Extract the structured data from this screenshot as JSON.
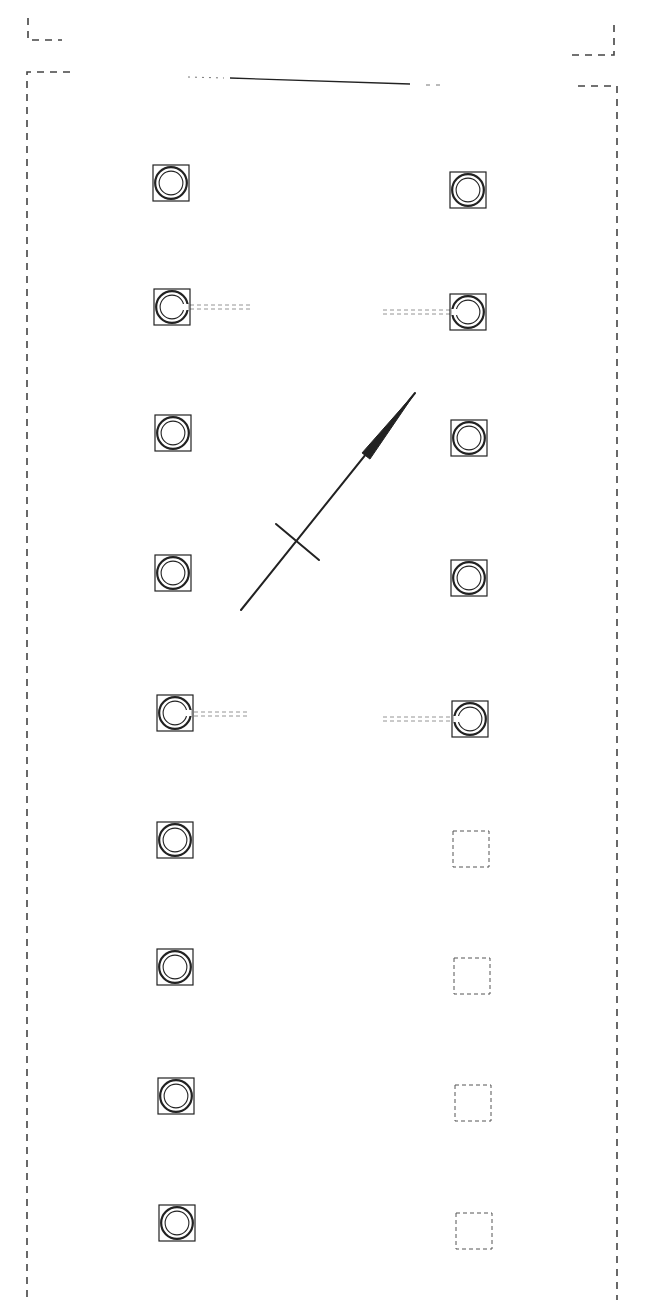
{
  "diagram": {
    "type": "architectural-plan",
    "canvas": {
      "width": 649,
      "height": 1309,
      "background": "#ffffff"
    },
    "stroke_color": "#222222",
    "dashed_color": "#444444",
    "boundary": {
      "upper_left_corner": {
        "x": 28,
        "y": 18,
        "hx": 62
      },
      "upper_right_corner": {
        "x": 614,
        "y": 25,
        "hx": 572
      },
      "outer_left": {
        "x": 27,
        "top": 72,
        "bottom": 1300,
        "hx": 70
      },
      "outer_right": {
        "x": 617,
        "top": 86,
        "bottom": 1300,
        "hx": 578
      },
      "top_line": {
        "x1": 230,
        "y1": 78,
        "x2": 410,
        "y2": 84,
        "dots_left": 188,
        "dots_right": 444
      }
    },
    "columns_left": [
      {
        "x": 153,
        "y": 165,
        "size": 36,
        "type": "column"
      },
      {
        "x": 154,
        "y": 289,
        "size": 36,
        "type": "column",
        "tie": "right"
      },
      {
        "x": 155,
        "y": 415,
        "size": 36,
        "type": "column"
      },
      {
        "x": 155,
        "y": 555,
        "size": 36,
        "type": "column"
      },
      {
        "x": 157,
        "y": 695,
        "size": 36,
        "type": "column",
        "tie": "right"
      },
      {
        "x": 157,
        "y": 822,
        "size": 36,
        "type": "column"
      },
      {
        "x": 157,
        "y": 949,
        "size": 36,
        "type": "column"
      },
      {
        "x": 158,
        "y": 1078,
        "size": 36,
        "type": "column"
      },
      {
        "x": 159,
        "y": 1205,
        "size": 36,
        "type": "column"
      }
    ],
    "columns_right": [
      {
        "x": 450,
        "y": 172,
        "size": 36,
        "type": "column"
      },
      {
        "x": 450,
        "y": 294,
        "size": 36,
        "type": "column",
        "tie": "left"
      },
      {
        "x": 451,
        "y": 420,
        "size": 36,
        "type": "column"
      },
      {
        "x": 451,
        "y": 560,
        "size": 36,
        "type": "column"
      },
      {
        "x": 452,
        "y": 701,
        "size": 36,
        "type": "column",
        "tie": "left"
      },
      {
        "x": 453,
        "y": 831,
        "size": 36,
        "type": "empty"
      },
      {
        "x": 454,
        "y": 958,
        "size": 36,
        "type": "empty"
      },
      {
        "x": 455,
        "y": 1085,
        "size": 36,
        "type": "empty"
      },
      {
        "x": 456,
        "y": 1213,
        "size": 36,
        "type": "empty"
      }
    ],
    "ties": [
      {
        "x1": 190,
        "y": 307,
        "x2": 250
      },
      {
        "x1": 383,
        "y": 312,
        "x2": 450
      },
      {
        "x1": 194,
        "y": 714,
        "x2": 250
      },
      {
        "x1": 383,
        "y": 719,
        "x2": 452
      }
    ],
    "north_arrow": {
      "tail": {
        "x": 241,
        "y": 610
      },
      "tip": {
        "x": 415,
        "y": 393
      },
      "head_base": {
        "x": 366,
        "y": 456
      },
      "cross": {
        "x1": 276,
        "y1": 524,
        "x2": 319,
        "y2": 560
      }
    }
  }
}
